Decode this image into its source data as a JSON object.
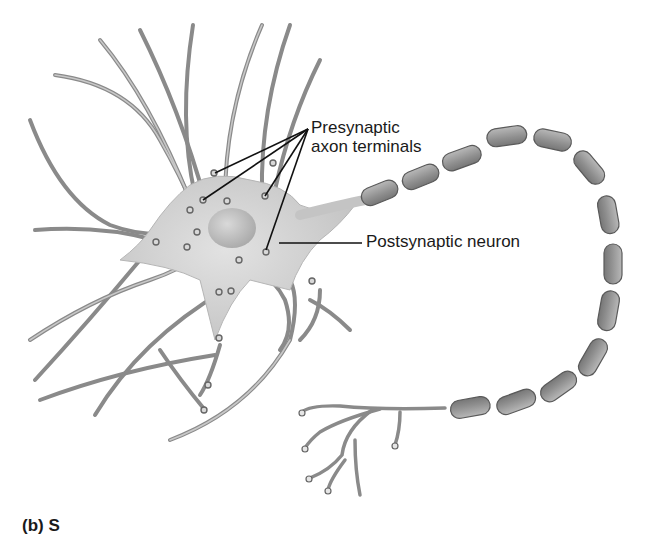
{
  "figure": {
    "type": "neuron-illustration",
    "labels": {
      "presynaptic_line1": "Presynaptic",
      "presynaptic_line2": "axon terminals",
      "postsynaptic": "Postsynaptic neuron"
    },
    "caption": "(b) S",
    "colors": {
      "background": "#ffffff",
      "cell_body": "#cfcfcf",
      "dendrite": "#a8a8a8",
      "dendrite_edge": "#6e6e6e",
      "myelin": "#9a9a9a",
      "myelin_edge": "#5a5a5a",
      "leader_line": "#111111",
      "text": "#1a1a1a"
    }
  }
}
